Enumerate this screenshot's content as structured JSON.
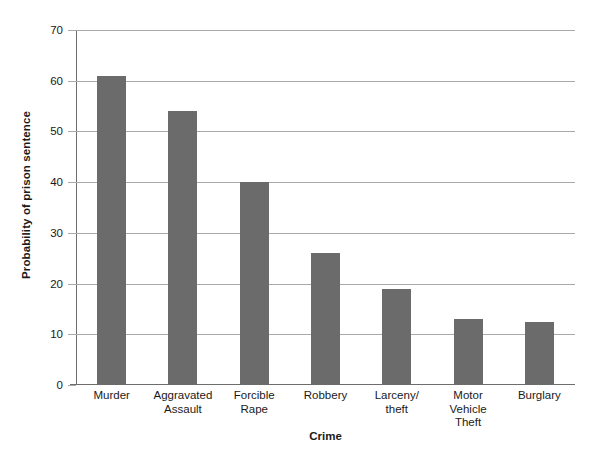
{
  "chart_data": {
    "type": "bar",
    "title": "",
    "xlabel": "Crime",
    "ylabel": "Probability of prison sentence",
    "categories": [
      "Murder",
      "Aggravated Assault",
      "Forcible Rape",
      "Robbery",
      "Larceny/theft",
      "Motor Vehicle Theft",
      "Burglary"
    ],
    "category_lines": [
      [
        "Murder"
      ],
      [
        "Aggravated",
        "Assault"
      ],
      [
        "Forcible",
        "Rape"
      ],
      [
        "Robbery"
      ],
      [
        "Larceny/",
        "theft"
      ],
      [
        "Motor",
        "Vehicle",
        "Theft"
      ],
      [
        "Burglary"
      ]
    ],
    "values": [
      61,
      54,
      40,
      26,
      19,
      13,
      12.5
    ],
    "ylim": [
      0,
      70
    ],
    "ytick_labels": [
      "0",
      "10",
      "20",
      "30",
      "40",
      "50",
      "60",
      "70"
    ],
    "yticks": [
      0,
      10,
      20,
      30,
      40,
      50,
      60,
      70
    ],
    "grid": "horizontal",
    "legend": "none",
    "bar_color": "#6b6b6b",
    "gridline_color": "#a9a9a9",
    "axis_color": "#6d6d6d",
    "background_color": "#ffffff"
  }
}
